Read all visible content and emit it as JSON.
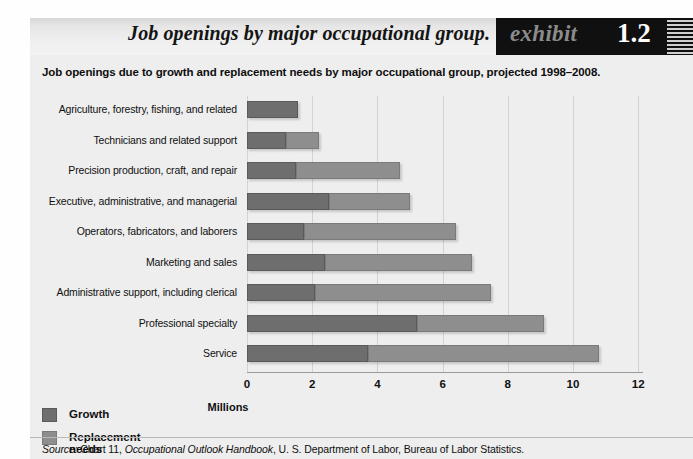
{
  "exhibit": {
    "title": "Job openings by major occupational group.",
    "label_word": "exhibit",
    "number": "1.2",
    "subtitle": "Job openings due to growth and replacement needs by major occupational group, projected 1998–2008.",
    "source_prefix": "Source:",
    "source_mid": " Chart 11, ",
    "source_italic": "Occupational Outlook Handbook",
    "source_tail": ", U. S. Department of Labor, Bureau of Labor Statistics."
  },
  "legend": {
    "items": [
      {
        "label": "Growth",
        "color": "#6e6e6e"
      },
      {
        "label": "Replacement needs",
        "color": "#8e8e8e"
      }
    ]
  },
  "chart_data": {
    "type": "bar",
    "orientation": "horizontal",
    "stacked": true,
    "title": "Job openings by major occupational group.",
    "subtitle": "Job openings due to growth and replacement needs by major occupational group, projected 1998–2008.",
    "xlabel": "Millions",
    "ylabel": "",
    "xlim": [
      0,
      12
    ],
    "xticks": [
      0,
      2,
      4,
      6,
      8,
      10,
      12
    ],
    "xticklabels": [
      "0",
      "2",
      "4",
      "6",
      "8",
      "10",
      "12"
    ],
    "grid": "vertical",
    "legend_position": "bottom-left",
    "categories": [
      "Agriculture, forestry, fishing, and related",
      "Technicians and related support",
      "Precision production, craft, and repair",
      "Executive, administrative, and managerial",
      "Operators, fabricators, and laborers",
      "Marketing and sales",
      "Administrative support, including clerical",
      "Professional specialty",
      "Service"
    ],
    "series": [
      {
        "name": "Growth",
        "color": "#6e6e6e",
        "values": [
          1.55,
          1.2,
          1.5,
          2.5,
          1.75,
          2.4,
          2.1,
          5.2,
          3.7
        ]
      },
      {
        "name": "Replacement needs",
        "color": "#8e8e8e",
        "values": [
          0.0,
          1.0,
          3.2,
          2.5,
          4.65,
          4.5,
          5.4,
          3.9,
          7.1
        ]
      }
    ],
    "totals": [
      1.55,
      2.2,
      4.7,
      5.0,
      6.4,
      6.9,
      7.5,
      9.1,
      10.8
    ],
    "units": "Millions"
  }
}
